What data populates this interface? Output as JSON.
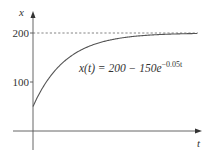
{
  "chart_data": {
    "type": "line",
    "title": "",
    "xlabel": "t",
    "ylabel": "x",
    "annotation": "x(t) = 200 − 150e^{−0.05t}",
    "equation": {
      "lhs": "x(t) = 200 − 150e",
      "exponent": "−0.05t"
    },
    "yticks": [
      100,
      200
    ],
    "ytick_labels": [
      "100",
      "200"
    ],
    "asymptote": {
      "y": 200,
      "style": "dashed"
    },
    "xlim": [
      0,
      100
    ],
    "ylim": [
      0,
      200
    ],
    "grid": false,
    "legend": null,
    "series": [
      {
        "name": "x(t) = 200 - 150e^(-0.05t)",
        "formula": {
          "A": 200,
          "B": 150,
          "k": 0.05
        },
        "x": [
          0,
          10,
          20,
          30,
          40,
          50,
          60,
          70,
          80,
          90,
          100
        ],
        "values": [
          50,
          109,
          144.8,
          166.5,
          179.7,
          187.7,
          192.5,
          195.5,
          197.3,
          198.3,
          199.0
        ]
      }
    ]
  },
  "axes": {
    "x_label": "t",
    "y_label": "x",
    "tick_200": "200",
    "tick_100": "100"
  },
  "colors": {
    "curve": "#555555",
    "axis": "#555555",
    "asymptote": "#777777",
    "text": "#333333"
  }
}
